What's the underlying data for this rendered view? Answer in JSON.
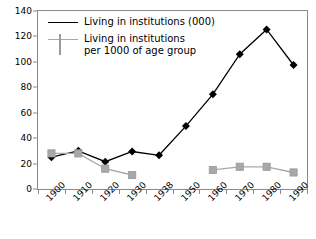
{
  "chart_data": {
    "type": "line",
    "title": "",
    "subtitle": "",
    "xlabel": "",
    "ylabel": "",
    "categories": [
      "1900",
      "1910",
      "1920",
      "1930",
      "1938",
      "1950",
      "1960",
      "1970",
      "1980",
      "1990"
    ],
    "ylim": [
      0,
      140
    ],
    "ytick_step": 20,
    "yticks": [
      "0",
      "20",
      "40",
      "60",
      "80",
      "100",
      "120",
      "140"
    ],
    "grid": false,
    "legend_position": "top-left",
    "series": [
      {
        "name": "Living in institutions (000)",
        "legend_label": "Living in institutions (000)",
        "color": "#000000",
        "marker": "diamond",
        "values": [
          25,
          30,
          21.5,
          29.5,
          26.5,
          49.5,
          74.5,
          106,
          125.5,
          97.5
        ]
      },
      {
        "name": "Living in institutions per 1000 of age group",
        "legend_label": "Living in institutions\nper 1000 of age group",
        "color": "#a8a8a8",
        "marker": "square",
        "values": [
          28,
          28,
          16,
          11,
          null,
          null,
          15,
          17.5,
          17.5,
          13
        ]
      }
    ]
  },
  "axes": {
    "frame_color": "#8a8a8a",
    "tick_color": "#8a8a8a",
    "label_color": "#000000"
  }
}
